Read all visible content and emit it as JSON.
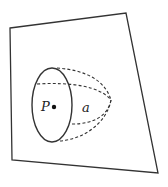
{
  "diagram": {
    "labels": {
      "point": "P",
      "surface": "a"
    },
    "colors": {
      "stroke": "#333333",
      "background": "#ffffff"
    },
    "plane": {
      "corners": [
        [
          10,
          28
        ],
        [
          126,
          13
        ],
        [
          158,
          173
        ],
        [
          12,
          160
        ]
      ]
    },
    "ellipse": {
      "cx": 52,
      "cy": 105,
      "rx": 20,
      "ry": 37
    },
    "point": {
      "x": 53,
      "y": 107
    }
  }
}
